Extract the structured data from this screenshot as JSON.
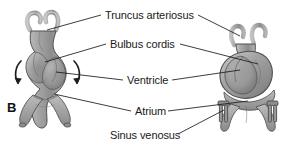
{
  "figure": {
    "panel_letter": "B",
    "background_color": "#ffffff",
    "tissue_fill": "#9a9a9a",
    "tissue_fill_light": "#bfbfbf",
    "tissue_fill_dark": "#6f6f6f",
    "outline_color": "#4a4a4a",
    "leader_line_color": "#1a1a1a",
    "text_color": "#1a1a1a"
  },
  "labels": {
    "truncus_arteriosus": "Truncus arteriosus",
    "bulbus_cordis": "Bulbus cordis",
    "ventricle": "Ventricle",
    "atrium": "Atrium",
    "sinus_venosus": "Sinus venosus"
  },
  "structures": {
    "left_heart": {
      "name": "straight-heart-tube",
      "arrows": [
        "looping-arrow-left",
        "looping-arrow-right"
      ]
    },
    "right_heart": {
      "name": "looped-heart-tube"
    }
  }
}
